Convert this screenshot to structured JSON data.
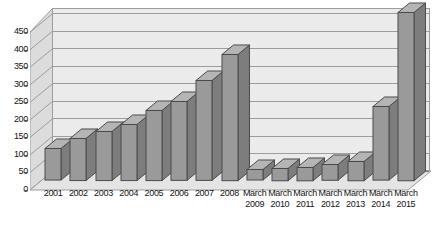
{
  "chart_data": {
    "type": "bar",
    "title": "",
    "subtitle": "",
    "xlabel": "",
    "ylabel": "",
    "grid": true,
    "legend": false,
    "ylim": [
      0,
      450
    ],
    "ytick_step": 50,
    "ytick_labels": [
      "450",
      "400",
      "350",
      "300",
      "250",
      "200",
      "150",
      "100",
      "50",
      "0"
    ],
    "ytick_values": [
      450,
      400,
      350,
      300,
      250,
      200,
      150,
      100,
      50,
      0
    ],
    "categories": [
      "2001",
      "2002",
      "2003",
      "2004",
      "2005",
      "2006",
      "2007",
      "2008",
      "March 2009",
      "March 2010",
      "March 2011",
      "March 2012",
      "March 2013",
      "March 2014",
      "March 2015"
    ],
    "category_lines": [
      [
        "2001",
        ""
      ],
      [
        "2002",
        ""
      ],
      [
        "2003",
        ""
      ],
      [
        "2004",
        ""
      ],
      [
        "2005",
        ""
      ],
      [
        "2006",
        ""
      ],
      [
        "2007",
        ""
      ],
      [
        "2008",
        ""
      ],
      [
        "March",
        "2009"
      ],
      [
        "March",
        "2010"
      ],
      [
        "March",
        "2011"
      ],
      [
        "March",
        "2012"
      ],
      [
        "March",
        "2013"
      ],
      [
        "March",
        "2014"
      ],
      [
        "March",
        "2015"
      ]
    ],
    "values": [
      90,
      120,
      140,
      160,
      200,
      225,
      285,
      360,
      30,
      35,
      38,
      45,
      55,
      210,
      480
    ],
    "series": [
      {
        "name": "Series 1",
        "values": [
          90,
          120,
          140,
          160,
          200,
          225,
          285,
          360,
          30,
          35,
          38,
          45,
          55,
          210,
          480
        ]
      }
    ]
  },
  "style": {
    "bar_face_color": "#9a9a9a",
    "bar_top_color": "#b5b5b5",
    "bar_side_color": "#7d7d7d",
    "bar_outline_color": "#4a4a4a",
    "plot_background": "#ebebeb",
    "wall_color": "#dcdcdc",
    "floor_color": "#e4e4e4",
    "gridline_color": "#9d9d9d",
    "axis_text_color": "#141414",
    "page_background": "#ffffff"
  }
}
